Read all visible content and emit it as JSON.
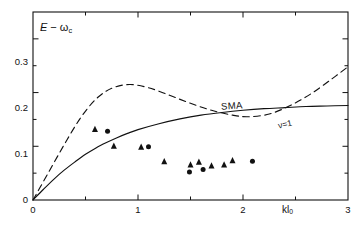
{
  "figure": {
    "background": "#ffffff",
    "ink": "#111111"
  },
  "axes": {
    "x": {
      "label": "kl",
      "label_sub": "0",
      "ticks": [
        "0",
        "1",
        "2",
        "3"
      ],
      "tick_values": [
        0,
        1,
        2,
        3
      ],
      "minor_step": 0.5,
      "range": [
        0,
        3
      ]
    },
    "y": {
      "label_lead": "E",
      "label_minus": "−",
      "label_omega": "ω",
      "label_omega_sub": "c",
      "ticks": [
        "0",
        "0.1",
        "0.2",
        "0.3"
      ],
      "tick_values": [
        0,
        0.1,
        0.2,
        0.3
      ],
      "range": [
        0,
        0.35
      ]
    }
  },
  "annotations": [
    {
      "name": "sma-curve-label",
      "text": "SMA",
      "x": 2.1,
      "y": 0.215
    },
    {
      "name": "nu-one-curve-label",
      "text": "ν=1",
      "x": 2.55,
      "y": 0.165
    }
  ],
  "chart_data": {
    "type": "line",
    "title": "",
    "xlabel": "kl0",
    "ylabel": "E - ωc",
    "xlim": [
      0,
      3
    ],
    "ylim": [
      0,
      0.35
    ],
    "grid": false,
    "legend": "inline-curve-labels",
    "series": [
      {
        "name": "SMA",
        "style": "solid",
        "color": "#111111",
        "x": [
          0.0,
          0.1,
          0.2,
          0.3,
          0.4,
          0.5,
          0.6,
          0.7,
          0.8,
          0.9,
          1.0,
          1.2,
          1.4,
          1.6,
          1.8,
          2.0,
          2.2,
          2.4,
          2.6,
          2.8,
          3.0
        ],
        "y": [
          0.0,
          0.02,
          0.039,
          0.056,
          0.071,
          0.085,
          0.097,
          0.107,
          0.116,
          0.124,
          0.131,
          0.142,
          0.151,
          0.158,
          0.163,
          0.167,
          0.17,
          0.172,
          0.174,
          0.175,
          0.176
        ]
      },
      {
        "name": "ν=1",
        "style": "dashed",
        "color": "#111111",
        "x": [
          0.0,
          0.15,
          0.3,
          0.45,
          0.6,
          0.75,
          0.92,
          1.1,
          1.3,
          1.5,
          1.7,
          1.9,
          2.05,
          2.25,
          2.45,
          2.65,
          2.85,
          3.0
        ],
        "y": [
          0.0,
          0.052,
          0.104,
          0.152,
          0.188,
          0.208,
          0.215,
          0.209,
          0.195,
          0.18,
          0.167,
          0.158,
          0.155,
          0.16,
          0.176,
          0.198,
          0.226,
          0.248
        ]
      }
    ],
    "scatter_series": [
      {
        "name": "triangle-data",
        "marker": "triangle",
        "color": "#111111",
        "points": [
          {
            "x": 0.59,
            "y": 0.131
          },
          {
            "x": 0.77,
            "y": 0.1
          },
          {
            "x": 1.03,
            "y": 0.098
          },
          {
            "x": 1.25,
            "y": 0.071
          },
          {
            "x": 1.5,
            "y": 0.065
          },
          {
            "x": 1.58,
            "y": 0.07
          },
          {
            "x": 1.7,
            "y": 0.063
          },
          {
            "x": 1.82,
            "y": 0.065
          },
          {
            "x": 1.9,
            "y": 0.073
          }
        ]
      },
      {
        "name": "circle-data",
        "marker": "circle",
        "color": "#111111",
        "points": [
          {
            "x": 0.71,
            "y": 0.128
          },
          {
            "x": 1.1,
            "y": 0.099
          },
          {
            "x": 1.49,
            "y": 0.052
          },
          {
            "x": 1.62,
            "y": 0.057
          },
          {
            "x": 2.09,
            "y": 0.072
          }
        ]
      }
    ]
  }
}
